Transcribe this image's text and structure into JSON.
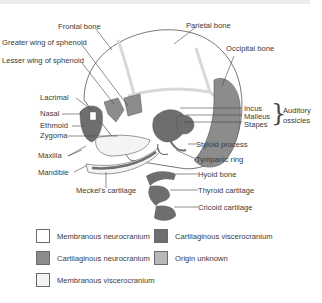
{
  "colors": {
    "membranous_neurocranium": "#ffffff",
    "cartilaginous_neurocranium": "#8c8c8c",
    "membranous_viscerocranium": "#f4f4f4",
    "cartilaginous_viscerocranium": "#6e6e6e",
    "origin_unknown": "#b8b8b8",
    "suture": "#dcdcdc",
    "outline": "#555555"
  },
  "labels": {
    "frontal_bone": "Frontal bone",
    "parietal_bone": "Parietal bone",
    "greater_wing": "Greater wing of sphenoid",
    "lesser_wing": "Lesser wing of sphenoid",
    "occipital_bone": "Occipital bone",
    "lacrimal": "Lacrimal",
    "nasal": "Nasal",
    "ethmoid": "Ethmoid",
    "zygoma": "Zygoma",
    "maxilla": "Maxilla",
    "mandible": "Mandible",
    "meckels_cartilage": "Meckel's cartilage",
    "incus": "Incus",
    "malleus": "Malleus",
    "stapes": "Stapes",
    "auditory_ossicles_line1": "Auditory",
    "auditory_ossicles_line2": "ossicles",
    "styloid_process": "Styloid process",
    "tympanic_ring": "Tympanic ring",
    "hyoid_bone": "Hyoid bone",
    "thyroid_cartilage": "Thyroid cartilage",
    "cricoid_cartilage": "Cricoid cartilage"
  },
  "legend": [
    {
      "label": "Membranous neurocranium",
      "color": "#ffffff"
    },
    {
      "label": "Cartilaginous viscerocranium",
      "color": "#6e6e6e"
    },
    {
      "label": "Cartilaginous neurocranium",
      "color": "#8c8c8c"
    },
    {
      "label": "Origin unknown",
      "color": "#b8b8b8"
    },
    {
      "label": "Membranous viscerocranium",
      "color": "#f4f4f4"
    }
  ]
}
